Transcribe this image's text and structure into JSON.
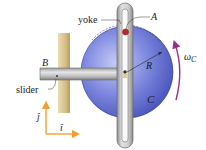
{
  "figure": {
    "labels": {
      "yoke": "yoke",
      "pin": "A",
      "slider_label": "slider",
      "slider_point": "B",
      "radius": "R",
      "disk": "C",
      "omega_symbol": "ω",
      "omega_sub": "C",
      "unit_j": "ĵ",
      "unit_i": "î"
    },
    "colors": {
      "disk": "#4a57c4",
      "disk_light": "#a7b0ec",
      "wall": "#d9c48e",
      "yoke": "#c9c9c9",
      "pin": "#c0272d",
      "omega_arrow": "#9a2f86",
      "axes": "#f0a030"
    }
  }
}
